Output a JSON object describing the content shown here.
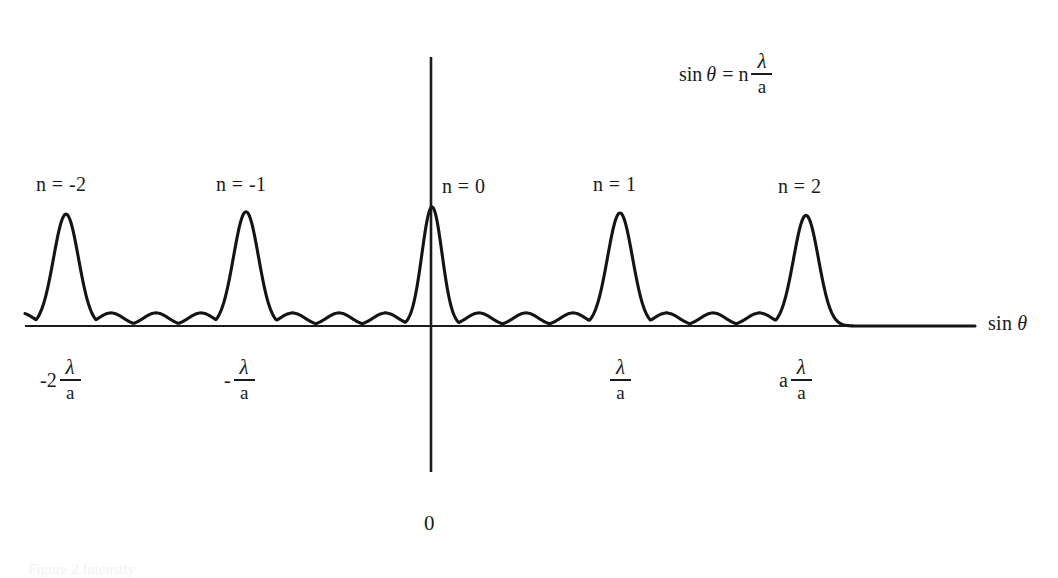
{
  "figure": {
    "kind": "diffraction-grating-intensity-diagram",
    "background_color": "#ffffff",
    "ink_color": "#1b1b1b",
    "formula": {
      "lead": "sin",
      "variable": "θ",
      "equals": "=",
      "coefficient": "n",
      "numerator": "λ",
      "denominator": "a"
    },
    "axis": {
      "x_label_lead": "sin",
      "x_label_var": "θ",
      "origin_label": "0"
    },
    "peak_labels": [
      {
        "text": "n = -2",
        "x": 36,
        "y": 174
      },
      {
        "text": "n = -1",
        "x": 216,
        "y": 174
      },
      {
        "text": "n = 0",
        "x": 442,
        "y": 176
      },
      {
        "text": "n = 1",
        "x": 593,
        "y": 174
      },
      {
        "text": "n = 2",
        "x": 778,
        "y": 176
      }
    ],
    "tick_labels": [
      {
        "lead": "-2",
        "numerator": "λ",
        "denominator": "a",
        "x": 40,
        "y": 358
      },
      {
        "lead": "-",
        "numerator": "λ",
        "denominator": "a",
        "x": 224,
        "y": 358
      },
      {
        "lead": "",
        "numerator": "λ",
        "denominator": "a",
        "x": 607,
        "y": 358
      },
      {
        "lead": "a",
        "numerator": "λ",
        "denominator": "a",
        "x": 779,
        "y": 358
      }
    ],
    "caption_remnant": "Figure 2  Intensity"
  },
  "chart_data": {
    "type": "line",
    "title": "",
    "xlabel": "sin θ",
    "ylabel": "",
    "grid": false,
    "legend": false,
    "xlim": [
      -2.45,
      3.2
    ],
    "ylim": [
      0,
      1.05
    ],
    "x_axis_pixel_y": 326,
    "y_axis_pixel_x": 431,
    "principal_maxima": [
      {
        "order": -2,
        "x_units": -2.0,
        "center_px": 66,
        "apex_px_y": 213,
        "height": 0.94,
        "half_width_px": 26
      },
      {
        "order": -1,
        "x_units": -1.0,
        "center_px": 246,
        "apex_px_y": 211,
        "height": 0.96,
        "half_width_px": 26
      },
      {
        "order": 0,
        "x_units": 0.0,
        "center_px": 432,
        "apex_px_y": 207,
        "height": 1.0,
        "half_width_px": 21
      },
      {
        "order": 1,
        "x_units": 1.0,
        "center_px": 620,
        "apex_px_y": 212,
        "height": 0.95,
        "half_width_px": 26
      },
      {
        "order": 2,
        "x_units": 2.0,
        "center_px": 806,
        "apex_px_y": 214,
        "height": 0.93,
        "half_width_px": 26
      }
    ],
    "secondary_maxima_per_gap": 3,
    "secondary_maxima_height": 0.11,
    "baseline_start_px": 25,
    "baseline_end_px": 975
  }
}
